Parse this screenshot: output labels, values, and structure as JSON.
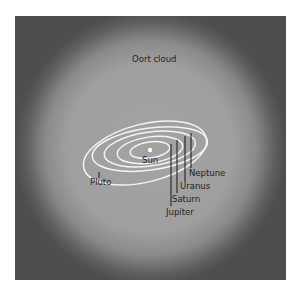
{
  "diagram": {
    "region_label": "Oort cloud",
    "center_label": "Sun",
    "planets": [
      {
        "name": "Jupiter"
      },
      {
        "name": "Saturn"
      },
      {
        "name": "Uranus"
      },
      {
        "name": "Neptune"
      },
      {
        "name": "Pluto"
      }
    ],
    "colors": {
      "background_outer": "#4e4e4e",
      "cloud": "#a1a1a1",
      "orbit": "#f4f4f4",
      "text": "#1e1e1e"
    }
  }
}
